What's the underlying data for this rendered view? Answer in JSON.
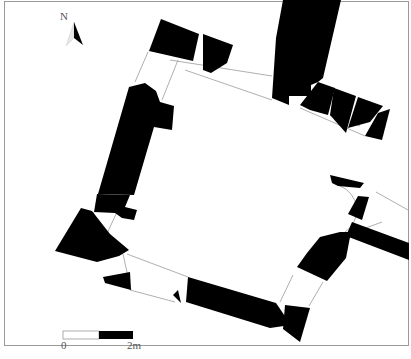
{
  "figure": {
    "type": "architectural-plan",
    "north_arrow": {
      "label": "N",
      "icon": "north-arrow-icon"
    },
    "scale_bar": {
      "start_label": "0",
      "end_label": "2m",
      "segments": [
        "white",
        "black"
      ]
    },
    "colors": {
      "wall": "#000000",
      "background": "#ffffff",
      "frame": "#9a9a9a",
      "outline": "#9a9a9a"
    }
  }
}
